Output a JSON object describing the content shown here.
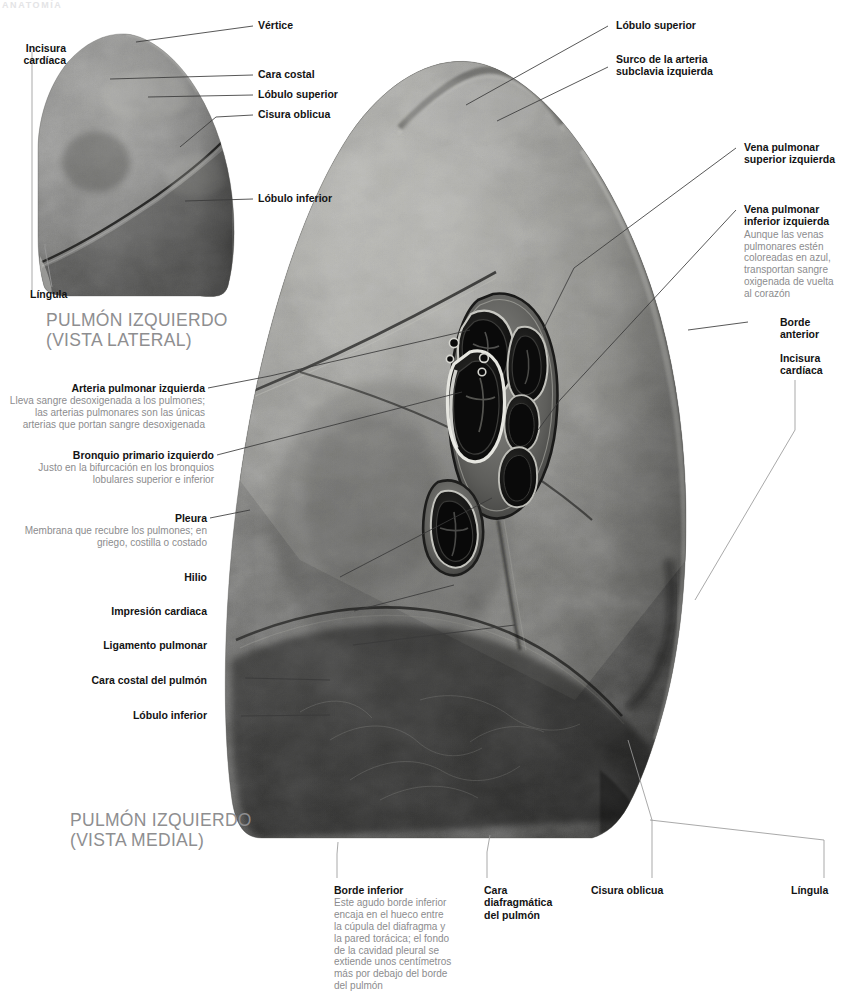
{
  "running_head": "ANATOMÍA",
  "captions": {
    "lateral": "PULMÓN IZQUIERDO\n(VISTA LATERAL)",
    "lateral_line1": "PULMÓN IZQUIERDO",
    "lateral_line2": "(VISTA LATERAL)",
    "medial_line1": "PULMÓN IZQUIERDO",
    "medial_line2": "(VISTA MEDIAL)"
  },
  "colors": {
    "text": "#131313",
    "description": "#8c8c8e",
    "caption": "#8e8e90",
    "leader": "#3a3a3a",
    "background": "#ffffff",
    "running_head": "#e4e4e6"
  },
  "labels": {
    "lateral_view": [
      {
        "id": "vertice",
        "title": "Vértice",
        "desc": ""
      },
      {
        "id": "incisura-cardiaca-lateral",
        "title": "Incisura\ncardíaca",
        "title_line1": "Incisura",
        "title_line2": "cardíaca",
        "desc": ""
      },
      {
        "id": "cara-costal",
        "title": "Cara costal",
        "desc": ""
      },
      {
        "id": "lobulo-superior-lateral",
        "title": "Lóbulo superior",
        "desc": ""
      },
      {
        "id": "cisura-oblicua-lateral",
        "title": "Cisura oblicua",
        "desc": ""
      },
      {
        "id": "lobulo-inferior-lateral",
        "title": "Lóbulo inferior",
        "desc": ""
      },
      {
        "id": "lingula-lateral",
        "title": "Língula",
        "desc": ""
      }
    ],
    "medial_left": [
      {
        "id": "arteria-pulmonar-izquierda",
        "title": "Arteria pulmonar izquierda",
        "desc": "Lleva sangre desoxigenada a los pulmones; las arterias pulmonares son las únicas arterias que portan sangre desoxigenada"
      },
      {
        "id": "bronquio-primario-izquierdo",
        "title": "Bronquio primario izquierdo",
        "desc": "Justo en la bifurcación en los bronquios lobulares superior e inferior"
      },
      {
        "id": "pleura",
        "title": "Pleura",
        "desc": "Membrana que recubre los pulmones; en griego, costilla o costado"
      },
      {
        "id": "hilio",
        "title": "Hilio",
        "desc": ""
      },
      {
        "id": "impresion-cardiaca",
        "title": "Impresión cardiaca",
        "desc": ""
      },
      {
        "id": "ligamento-pulmonar",
        "title": "Ligamento pulmonar",
        "desc": ""
      },
      {
        "id": "cara-costal-del-pulmon",
        "title": "Cara costal del pulmón",
        "desc": ""
      },
      {
        "id": "lobulo-inferior-medial",
        "title": "Lóbulo inferior",
        "desc": ""
      }
    ],
    "medial_right": [
      {
        "id": "lobulo-superior-medial",
        "title": "Lóbulo superior",
        "desc": ""
      },
      {
        "id": "surco-arteria-subclavia",
        "title": "Surco de la arteria\nsubclavia izquierda",
        "title_line1": "Surco de la arteria",
        "title_line2": "subclavia izquierda",
        "desc": ""
      },
      {
        "id": "vena-pulmonar-superior-izquierda",
        "title": "Vena pulmonar\nsuperior izquierda",
        "title_line1": "Vena pulmonar",
        "title_line2": "superior izquierda",
        "desc": ""
      },
      {
        "id": "vena-pulmonar-inferior-izquierda",
        "title": "Vena pulmonar\ninferior izquierda",
        "title_line1": "Vena pulmonar",
        "title_line2": "inferior izquierda",
        "desc": "Aunque las venas pulmonares estén coloreadas en azul, transportan sangre oxigenada de vuelta al corazón"
      },
      {
        "id": "borde-anterior",
        "title": "Borde\nanterior",
        "title_line1": "Borde",
        "title_line2": "anterior",
        "desc": ""
      },
      {
        "id": "incisura-cardiaca-medial",
        "title": "Incisura\ncardíaca",
        "title_line1": "Incisura",
        "title_line2": "cardíaca",
        "desc": ""
      }
    ],
    "bottom": [
      {
        "id": "borde-inferior",
        "title": "Borde inferior",
        "desc": "Este agudo borde inferior encaja en el hueco entre la cúpula del diafragma y la pared torácica; el fondo de la cavidad pleural se extiende unos centímetros más por debajo del borde del pulmón"
      },
      {
        "id": "cara-diafragmatica-del-pulmon",
        "title": "Cara\ndiafragmática\ndel pulmón",
        "title_line1": "Cara",
        "title_line2": "diafragmática",
        "title_line3": "del pulmón",
        "desc": ""
      },
      {
        "id": "cisura-oblicua-medial",
        "title": "Cisura oblicua",
        "desc": ""
      },
      {
        "id": "lingula-medial",
        "title": "Língula",
        "desc": ""
      }
    ]
  }
}
